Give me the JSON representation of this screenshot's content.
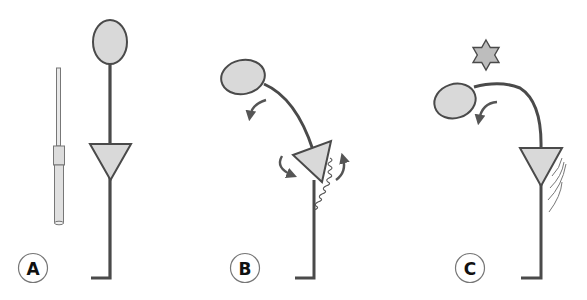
{
  "diagram": {
    "panels": [
      {
        "id": "A",
        "label": "A",
        "description": "Upright structure with probe"
      },
      {
        "id": "B",
        "label": "B",
        "description": "Bending with rotational arrows and wavy deflection"
      },
      {
        "id": "C",
        "label": "C",
        "description": "Stimulus (star) causes bending; motion lines at hinge"
      }
    ],
    "colors": {
      "stroke": "#4a4a4a",
      "fill": "#d9d9d9",
      "label_ring": "#777777",
      "background": "#ffffff"
    },
    "icons": {
      "stimulus": "six-pointed-star-icon",
      "rotation": "curved-arrow-icon",
      "probe": "probe-rod-icon"
    }
  }
}
